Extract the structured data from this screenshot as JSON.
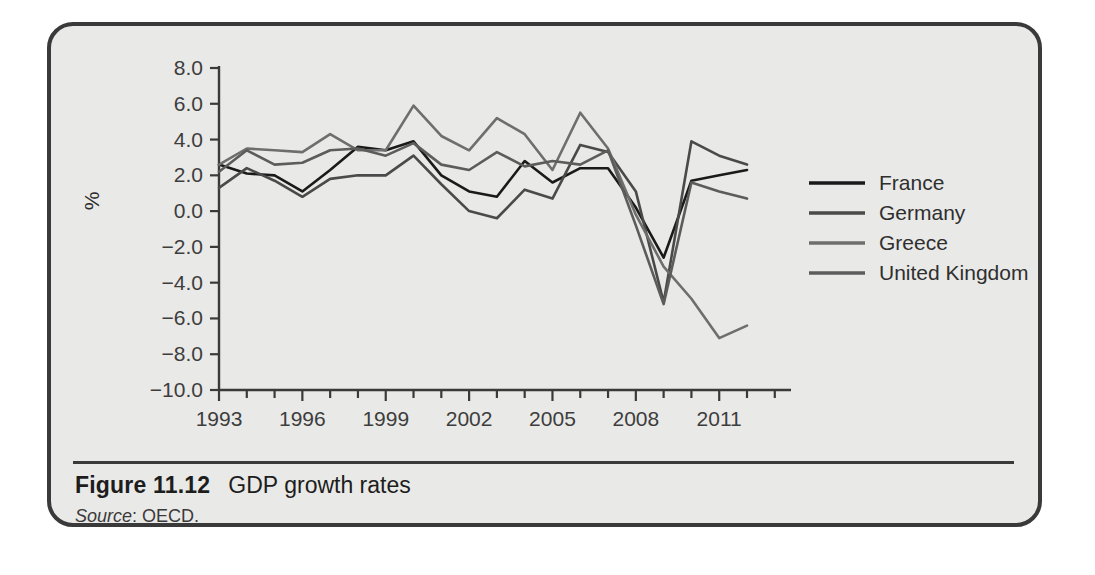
{
  "figure": {
    "number": "Figure 11.12",
    "title": "GDP growth rates",
    "source_label": "Source",
    "source_value": ": OECD."
  },
  "chart_data": {
    "type": "line",
    "title": "GDP growth rates",
    "xlabel": "",
    "ylabel": "%",
    "ylim": [
      -10.0,
      8.0
    ],
    "xlim": [
      1993,
      2012
    ],
    "grid": false,
    "legend_position": "right",
    "ytick_labels": [
      "8.0",
      "6.0",
      "4.0",
      "2.0",
      "0.0",
      "-2.0",
      "-4.0",
      "-6.0",
      "-8.0",
      "-10.0"
    ],
    "yticks": [
      8,
      6,
      4,
      2,
      0,
      -2,
      -4,
      -6,
      -8,
      -10
    ],
    "xtick_labels": [
      "1993",
      "1996",
      "1999",
      "2002",
      "2005",
      "2008",
      "2011"
    ],
    "xticks_labeled": [
      1993,
      1996,
      1999,
      2002,
      2005,
      2008,
      2011
    ],
    "x": [
      1993,
      1994,
      1995,
      1996,
      1997,
      1998,
      1999,
      2000,
      2001,
      2002,
      2003,
      2004,
      2005,
      2006,
      2007,
      2008,
      2009,
      2010,
      2011,
      2012
    ],
    "series": [
      {
        "name": "France",
        "color": "#1a1a1a",
        "width": 2.6,
        "values": [
          2.6,
          2.1,
          2.0,
          1.1,
          2.3,
          3.6,
          3.4,
          3.9,
          2.0,
          1.1,
          0.8,
          2.8,
          1.6,
          2.4,
          2.4,
          0.2,
          -2.6,
          1.7,
          2.0,
          2.3
        ]
      },
      {
        "name": "Germany",
        "color": "#4a4a4a",
        "width": 2.6,
        "values": [
          1.3,
          2.4,
          1.7,
          0.8,
          1.8,
          2.0,
          2.0,
          3.1,
          1.5,
          0.0,
          -0.4,
          1.2,
          0.7,
          3.7,
          3.3,
          1.1,
          -5.1,
          3.9,
          3.1,
          2.6
        ]
      },
      {
        "name": "Greece",
        "color": "#6e6e6e",
        "width": 2.6,
        "values": [
          2.6,
          3.5,
          3.4,
          3.3,
          4.3,
          3.4,
          3.4,
          5.9,
          4.2,
          3.4,
          5.2,
          4.3,
          2.3,
          5.5,
          3.5,
          -0.2,
          -3.1,
          -4.9,
          -7.1,
          -6.4
        ]
      },
      {
        "name": "United Kingdom",
        "color": "#5c5c5c",
        "width": 2.6,
        "values": [
          2.2,
          3.4,
          2.6,
          2.7,
          3.4,
          3.5,
          3.1,
          3.8,
          2.6,
          2.3,
          3.3,
          2.5,
          2.8,
          2.6,
          3.4,
          -0.8,
          -5.2,
          1.6,
          1.1,
          0.7
        ]
      }
    ],
    "legend_entries": [
      {
        "label": "France",
        "color": "#1a1a1a"
      },
      {
        "label": "Germany",
        "color": "#4a4a4a"
      },
      {
        "label": "Greece",
        "color": "#6e6e6e"
      },
      {
        "label": "United Kingdom",
        "color": "#5c5c5c"
      }
    ]
  }
}
